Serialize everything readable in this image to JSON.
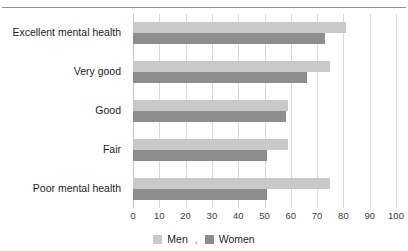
{
  "chart_data": {
    "type": "bar",
    "orientation": "horizontal",
    "title": "",
    "xlabel": "",
    "ylabel": "",
    "xlim": [
      0,
      100
    ],
    "xticks": [
      "0",
      "10",
      "20",
      "30",
      "40",
      "50",
      "60",
      "70",
      "80",
      "90",
      "100"
    ],
    "grid": true,
    "legend_position": "bottom",
    "categories": [
      "Excellent mental health",
      "Very good",
      "Good",
      "Fair",
      "Poor mental health"
    ],
    "series": [
      {
        "name": "Men",
        "color": "#c9c9c9",
        "values": [
          81,
          75,
          59,
          59,
          75
        ]
      },
      {
        "name": "Women",
        "color": "#8d8d8d",
        "values": [
          73,
          66,
          58,
          51,
          51
        ]
      }
    ]
  },
  "legend": {
    "separator": ",",
    "items": [
      {
        "label": "Men",
        "swatch_color": "#c9c9c9",
        "icon": "legend-swatch-icon"
      },
      {
        "label": "Women",
        "swatch_color": "#8d8d8d",
        "icon": "legend-swatch-icon"
      }
    ]
  },
  "decor": {
    "title_ghost": "",
    "rule_color": "#8e8e8e"
  }
}
